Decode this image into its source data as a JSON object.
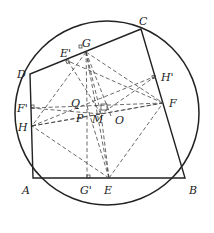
{
  "diagram": {
    "type": "geometry",
    "circle": {
      "cx": 107,
      "cy": 113,
      "r": 92
    },
    "points": {
      "A": {
        "x": 33,
        "y": 178,
        "label": "A",
        "lx": 22,
        "ly": 194
      },
      "B": {
        "x": 185,
        "y": 178,
        "label": "B",
        "lx": 189,
        "ly": 194
      },
      "C": {
        "x": 141,
        "y": 29,
        "label": "C",
        "lx": 139,
        "ly": 25
      },
      "D": {
        "x": 30,
        "y": 74,
        "label": "D",
        "lx": 17,
        "ly": 78
      },
      "E": {
        "x": 109,
        "y": 178,
        "label": "E",
        "lx": 104,
        "ly": 194
      },
      "F": {
        "x": 163,
        "y": 103,
        "label": "F",
        "lx": 169,
        "ly": 107
      },
      "G": {
        "x": 86,
        "y": 52,
        "label": "G",
        "lx": 82,
        "ly": 47
      },
      "H": {
        "x": 32,
        "y": 126,
        "label": "H",
        "lx": 18,
        "ly": 131
      },
      "E'": {
        "x": 68,
        "y": 61,
        "label": "E'",
        "lx": 60,
        "ly": 57
      },
      "F'": {
        "x": 31,
        "y": 108,
        "label": "F'",
        "lx": 17,
        "ly": 112
      },
      "G'": {
        "x": 87,
        "y": 178,
        "label": "G'",
        "lx": 80,
        "ly": 194
      },
      "H'": {
        "x": 156,
        "y": 76,
        "label": "H'",
        "lx": 161,
        "ly": 81
      },
      "Q": {
        "x": 87,
        "y": 106,
        "label": "Q",
        "lx": 71,
        "ly": 107
      },
      "P": {
        "x": 88,
        "y": 113,
        "label": "P",
        "lx": 76,
        "ly": 122
      },
      "M": {
        "x": 101,
        "y": 114,
        "label": "M",
        "lx": 94,
        "ly": 123
      },
      "O": {
        "x": 111,
        "y": 116,
        "label": "O",
        "lx": 115,
        "ly": 124
      }
    },
    "labels": [
      "A",
      "B",
      "C",
      "D",
      "E",
      "F",
      "G",
      "H",
      "E'",
      "F'",
      "G'",
      "H'",
      "Q",
      "P",
      "M",
      "O"
    ]
  }
}
